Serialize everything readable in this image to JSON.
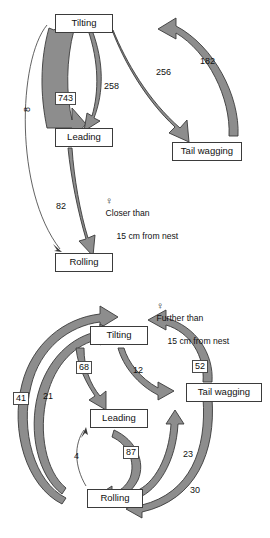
{
  "figure": {
    "type": "behavioural-transition-diagram",
    "panels": [
      {
        "id": "panel-closer",
        "legend": {
          "symbol": "♀",
          "line1": "Closer than",
          "line2": "15 cm from nest"
        },
        "nodes": [
          {
            "id": "tilting",
            "label": "Tilting"
          },
          {
            "id": "leading",
            "label": "Leading"
          },
          {
            "id": "rolling",
            "label": "Rolling"
          },
          {
            "id": "tail-wagging",
            "label": "Tail wagging"
          }
        ],
        "transitions": [
          {
            "from": "Tilting",
            "to": "Leading",
            "value": "743",
            "style": "band",
            "boxed": true
          },
          {
            "from": "Leading",
            "to": "Tilting",
            "value": "258",
            "style": "band",
            "boxed": false
          },
          {
            "from": "Tilting",
            "to": "Tail wagging",
            "value": "256",
            "style": "band",
            "boxed": false
          },
          {
            "from": "Tail wagging",
            "to": "Tilting",
            "value": "182",
            "style": "band",
            "boxed": false
          },
          {
            "from": "Leading",
            "to": "Rolling",
            "value": "82",
            "style": "band",
            "boxed": false
          },
          {
            "from": "Tilting",
            "to": "Rolling",
            "value": "8",
            "style": "thin",
            "boxed": false
          }
        ]
      },
      {
        "id": "panel-further",
        "legend": {
          "symbol": "♀",
          "line1": "Further than",
          "line2": "15 cm from nest"
        },
        "nodes": [
          {
            "id": "tilting",
            "label": "Tilting"
          },
          {
            "id": "leading",
            "label": "Leading"
          },
          {
            "id": "rolling",
            "label": "Rolling"
          },
          {
            "id": "tail-wagging",
            "label": "Tail wagging"
          }
        ],
        "transitions": [
          {
            "from": "Tilting",
            "to": "Leading",
            "value": "68",
            "style": "band",
            "boxed": true
          },
          {
            "from": "Tilting",
            "to": "Tail wagging",
            "value": "12",
            "style": "band",
            "boxed": false
          },
          {
            "from": "Tail wagging",
            "to": "Tilting",
            "value": "52",
            "style": "band",
            "boxed": true
          },
          {
            "from": "Rolling",
            "to": "Tilting",
            "value": "41",
            "style": "band",
            "boxed": true
          },
          {
            "from": "Rolling",
            "to": "Tilting",
            "value": "21",
            "style": "band",
            "boxed": false
          },
          {
            "from": "Rolling",
            "to": "Leading",
            "value": "4",
            "style": "thin",
            "boxed": false
          },
          {
            "from": "Leading",
            "to": "Rolling",
            "value": "87",
            "style": "band",
            "boxed": true
          },
          {
            "from": "Rolling",
            "to": "Tail wagging",
            "value": "23",
            "style": "band",
            "boxed": false
          },
          {
            "from": "Tail wagging",
            "to": "Rolling",
            "value": "30",
            "style": "band",
            "boxed": false
          }
        ]
      }
    ]
  }
}
